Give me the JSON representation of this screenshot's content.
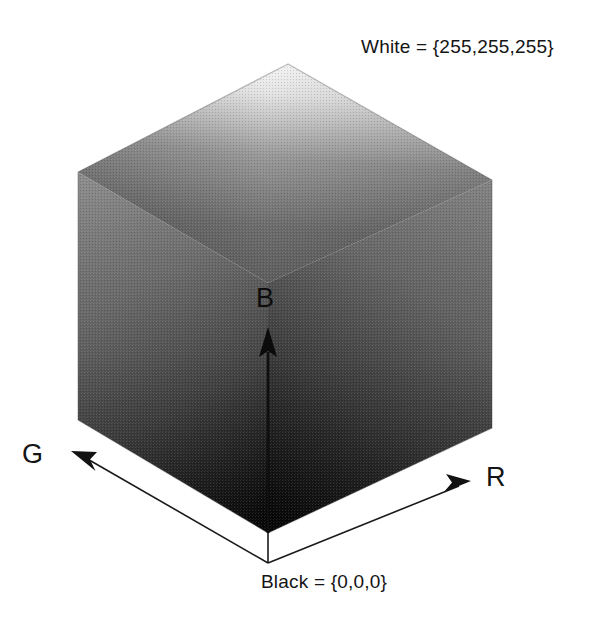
{
  "figure": {
    "title_hidden": "RGB color cube diagram",
    "corner_labels": {
      "white": "White = {255,255,255}",
      "black": "Black = {0,0,0}"
    },
    "axes": [
      {
        "name": "green-axis",
        "label": "G",
        "direction": "lower-left"
      },
      {
        "name": "red-axis",
        "label": "R",
        "direction": "lower-right"
      },
      {
        "name": "blue-axis",
        "label": "B",
        "direction": "up"
      }
    ],
    "colors": {
      "background": "#ffffff",
      "ink": "#141414",
      "face_top_light": "#f2f2f2",
      "face_top_dark": "#6a6a6a",
      "face_left_light": "#7a7a7a",
      "face_left_dark": "#0a0a0a",
      "face_right_light": "#6f6f6f",
      "face_right_dark": "#090909",
      "outline": "#2b2b2b"
    },
    "geometry": {
      "apex_top": [
        288,
        64
      ],
      "left_upper": [
        78,
        172
      ],
      "right_upper": [
        492,
        180
      ],
      "left_lower": [
        78,
        420
      ],
      "right_lower": [
        492,
        428
      ],
      "bottom_vertex": [
        268,
        533
      ],
      "center": [
        268,
        283
      ],
      "origin": [
        268,
        563
      ],
      "g_arrow_tip": [
        72,
        452
      ],
      "r_arrow_tip": [
        470,
        481
      ],
      "b_arrow_tip": [
        268,
        328
      ]
    }
  }
}
